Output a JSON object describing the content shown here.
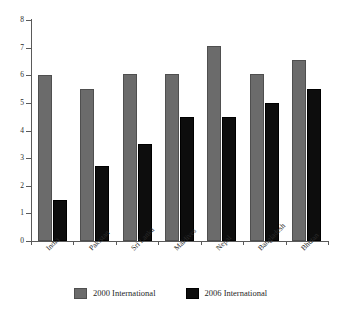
{
  "chart_data": {
    "type": "bar",
    "title": "",
    "subtitle": "",
    "xlabel": "",
    "ylabel": "",
    "ylim": [
      0,
      8
    ],
    "yticks": [
      0,
      1,
      2,
      3,
      4,
      5,
      6,
      7,
      8
    ],
    "grid": false,
    "legend_position": "bottom-center",
    "categories": [
      "India",
      "Pakistan",
      "Sri Lanka",
      "Maldives",
      "Nepal",
      "Bangladesh",
      "Bhutan"
    ],
    "series": [
      {
        "name": "2000 International",
        "color": "#6b6b6b",
        "values": [
          6.0,
          5.5,
          6.05,
          6.05,
          7.05,
          6.05,
          6.55
        ]
      },
      {
        "name": "2006 International",
        "color": "#0d0d0d",
        "values": [
          1.5,
          2.7,
          3.5,
          4.5,
          4.5,
          5.0,
          5.5
        ]
      }
    ]
  },
  "axis": {
    "y_tick_labels": [
      "0",
      "1",
      "2",
      "3",
      "4",
      "5",
      "6",
      "7",
      "8"
    ]
  },
  "legend": {
    "items": [
      {
        "label": "2000 International",
        "swatch": "series-2000-swatch"
      },
      {
        "label": "2006 International",
        "swatch": "series-2006-swatch"
      }
    ]
  }
}
